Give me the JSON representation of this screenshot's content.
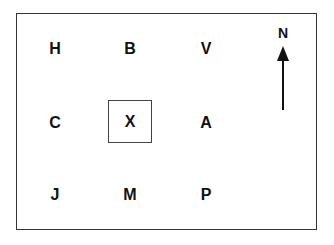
{
  "grid": {
    "rows": [
      [
        "H",
        "B",
        "V"
      ],
      [
        "C",
        "X",
        "A"
      ],
      [
        "J",
        "M",
        "P"
      ]
    ],
    "highlighted": "X"
  },
  "compass": {
    "label": "N",
    "direction": "up"
  }
}
